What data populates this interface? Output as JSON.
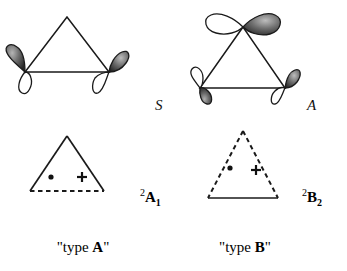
{
  "figure": {
    "background_color": "#ffffff",
    "stroke_color": "#1a1a1a",
    "lobe_filled_color": "#4a4a4a",
    "lobe_empty_color": "#ffffff"
  },
  "panels": [
    {
      "id": "type-a",
      "orbital_diagram": {
        "name": "orbital-diagram-a",
        "triangle_style": "solid",
        "orbitals": [
          {
            "position": "bottom-left",
            "orientation": "tilted",
            "filled_lobe": "upper-outer"
          },
          {
            "position": "bottom-right",
            "orientation": "tilted",
            "filled_lobe": "upper-outer"
          }
        ]
      },
      "symmetry_label": "S",
      "state_diagram": {
        "name": "state-diagram-a",
        "sides_style": "solid",
        "base_style": "dashed",
        "markers": [
          "•",
          "+"
        ]
      },
      "term_symbol": {
        "superscript": "2",
        "letter": "A",
        "subscript": "1"
      },
      "caption": {
        "prefix": "\"type ",
        "bold": "A",
        "suffix": "\""
      }
    },
    {
      "id": "type-b",
      "orbital_diagram": {
        "name": "orbital-diagram-b",
        "triangle_style": "solid",
        "orbitals": [
          {
            "position": "apex",
            "orientation": "horizontal",
            "filled_lobe": "right"
          },
          {
            "position": "bottom-left",
            "orientation": "tilted",
            "filled_lobe": "lower-inner"
          },
          {
            "position": "bottom-right",
            "orientation": "tilted",
            "filled_lobe": "upper-outer"
          }
        ]
      },
      "symmetry_label": "A",
      "state_diagram": {
        "name": "state-diagram-b",
        "sides_style": "dashed",
        "base_style": "solid",
        "markers": [
          "•",
          "+"
        ]
      },
      "term_symbol": {
        "superscript": "2",
        "letter": "B",
        "subscript": "2"
      },
      "caption": {
        "prefix": "\"type ",
        "bold": "B",
        "suffix": "\""
      }
    }
  ]
}
